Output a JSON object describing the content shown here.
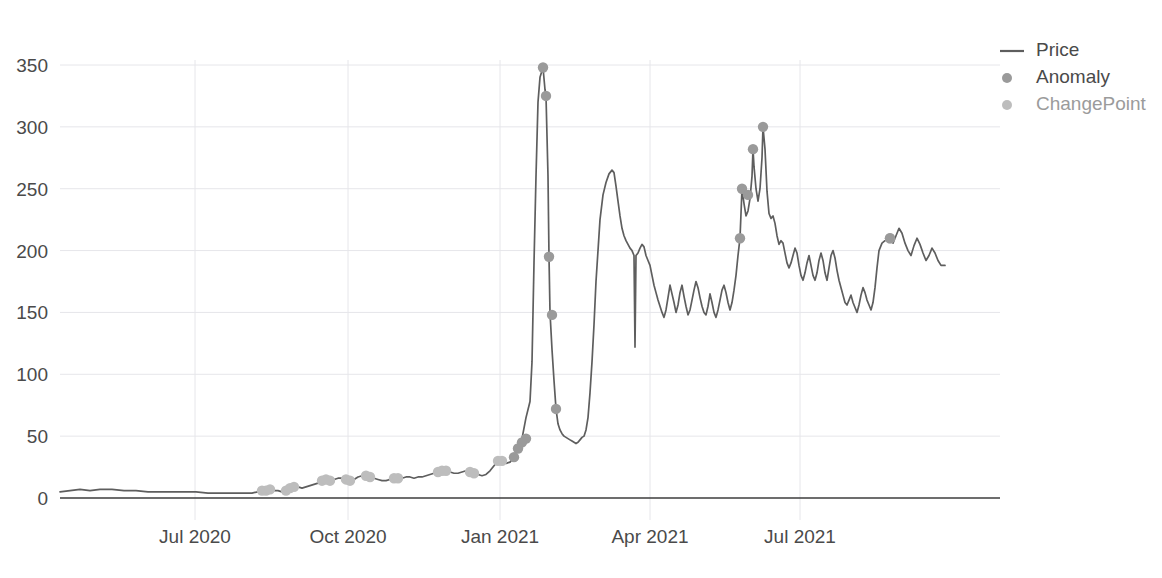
{
  "chart_data": {
    "type": "line",
    "title": "",
    "xlabel": "",
    "ylabel": "",
    "ylim": [
      0,
      365
    ],
    "yticks": [
      0,
      50,
      100,
      150,
      200,
      250,
      300,
      350
    ],
    "ytick_labels": [
      "0",
      "50",
      "100",
      "150",
      "200",
      "250",
      "300",
      "350"
    ],
    "xtick_labels": [
      "Jul 2020",
      "Oct 2020",
      "Jan 2021",
      "Apr 2021",
      "Jul 2021"
    ],
    "xtick_positions": [
      195,
      348,
      500,
      650,
      800
    ],
    "grid": true,
    "legend_position": "right",
    "legend": [
      {
        "name": "Price",
        "marker": "line",
        "color": "#5e5e5e",
        "muted": false
      },
      {
        "name": "Anomaly",
        "marker": "dot",
        "color": "#9a9a9a",
        "muted": false
      },
      {
        "name": "ChangePoint",
        "marker": "dot",
        "color": "#bdbdbd",
        "muted": true
      }
    ],
    "series": [
      {
        "name": "Price",
        "type": "line",
        "points": [
          [
            60,
            5
          ],
          [
            70,
            6
          ],
          [
            80,
            7
          ],
          [
            90,
            6
          ],
          [
            100,
            7
          ],
          [
            112,
            7
          ],
          [
            124,
            6
          ],
          [
            136,
            6
          ],
          [
            148,
            5
          ],
          [
            160,
            5
          ],
          [
            172,
            5
          ],
          [
            184,
            5
          ],
          [
            196,
            5
          ],
          [
            208,
            4
          ],
          [
            220,
            4
          ],
          [
            232,
            4
          ],
          [
            244,
            4
          ],
          [
            252,
            4
          ],
          [
            258,
            5
          ],
          [
            262,
            6
          ],
          [
            266,
            6
          ],
          [
            270,
            7
          ],
          [
            274,
            6
          ],
          [
            278,
            6
          ],
          [
            282,
            5
          ],
          [
            286,
            6
          ],
          [
            290,
            8
          ],
          [
            294,
            9
          ],
          [
            298,
            9
          ],
          [
            302,
            8
          ],
          [
            306,
            9
          ],
          [
            310,
            10
          ],
          [
            314,
            11
          ],
          [
            318,
            12
          ],
          [
            322,
            14
          ],
          [
            326,
            15
          ],
          [
            330,
            14
          ],
          [
            334,
            15
          ],
          [
            338,
            16
          ],
          [
            342,
            16
          ],
          [
            346,
            15
          ],
          [
            350,
            14
          ],
          [
            354,
            15
          ],
          [
            358,
            17
          ],
          [
            362,
            18
          ],
          [
            366,
            18
          ],
          [
            370,
            17
          ],
          [
            374,
            16
          ],
          [
            378,
            15
          ],
          [
            382,
            14
          ],
          [
            386,
            14
          ],
          [
            390,
            15
          ],
          [
            394,
            16
          ],
          [
            398,
            16
          ],
          [
            402,
            16
          ],
          [
            406,
            17
          ],
          [
            410,
            17
          ],
          [
            414,
            16
          ],
          [
            418,
            17
          ],
          [
            422,
            17
          ],
          [
            426,
            18
          ],
          [
            430,
            19
          ],
          [
            434,
            20
          ],
          [
            438,
            21
          ],
          [
            442,
            22
          ],
          [
            446,
            22
          ],
          [
            450,
            21
          ],
          [
            454,
            20
          ],
          [
            458,
            20
          ],
          [
            462,
            21
          ],
          [
            466,
            22
          ],
          [
            470,
            21
          ],
          [
            474,
            20
          ],
          [
            478,
            19
          ],
          [
            482,
            18
          ],
          [
            486,
            19
          ],
          [
            490,
            22
          ],
          [
            494,
            26
          ],
          [
            498,
            30
          ],
          [
            502,
            30
          ],
          [
            506,
            28
          ],
          [
            510,
            29
          ],
          [
            514,
            33
          ],
          [
            518,
            40
          ],
          [
            522,
            48
          ],
          [
            526,
            65
          ],
          [
            530,
            78
          ],
          [
            532,
            110
          ],
          [
            534,
            190
          ],
          [
            536,
            260
          ],
          [
            538,
            320
          ],
          [
            540,
            340
          ],
          [
            543,
            348
          ],
          [
            545,
            330
          ],
          [
            546,
            325
          ],
          [
            548,
            260
          ],
          [
            549,
            195
          ],
          [
            550,
            150
          ],
          [
            552,
            120
          ],
          [
            554,
            95
          ],
          [
            556,
            72
          ],
          [
            558,
            60
          ],
          [
            560,
            55
          ],
          [
            562,
            52
          ],
          [
            564,
            50
          ],
          [
            566,
            49
          ],
          [
            568,
            48
          ],
          [
            570,
            47
          ],
          [
            572,
            46
          ],
          [
            574,
            45
          ],
          [
            576,
            44
          ],
          [
            578,
            45
          ],
          [
            580,
            47
          ],
          [
            582,
            49
          ],
          [
            584,
            50
          ],
          [
            586,
            55
          ],
          [
            588,
            65
          ],
          [
            590,
            85
          ],
          [
            592,
            110
          ],
          [
            594,
            140
          ],
          [
            596,
            175
          ],
          [
            598,
            200
          ],
          [
            600,
            225
          ],
          [
            603,
            245
          ],
          [
            606,
            255
          ],
          [
            609,
            262
          ],
          [
            612,
            265
          ],
          [
            614,
            263
          ],
          [
            616,
            252
          ],
          [
            618,
            240
          ],
          [
            620,
            228
          ],
          [
            622,
            218
          ],
          [
            624,
            212
          ],
          [
            626,
            208
          ],
          [
            628,
            205
          ],
          [
            630,
            202
          ],
          [
            632,
            200
          ],
          [
            634,
            196
          ],
          [
            635,
            122
          ],
          [
            636,
            196
          ],
          [
            638,
            198
          ],
          [
            640,
            202
          ],
          [
            642,
            205
          ],
          [
            644,
            203
          ],
          [
            646,
            196
          ],
          [
            648,
            192
          ],
          [
            650,
            188
          ],
          [
            652,
            180
          ],
          [
            654,
            172
          ],
          [
            656,
            166
          ],
          [
            658,
            160
          ],
          [
            660,
            155
          ],
          [
            662,
            150
          ],
          [
            664,
            146
          ],
          [
            666,
            152
          ],
          [
            668,
            162
          ],
          [
            670,
            172
          ],
          [
            672,
            165
          ],
          [
            674,
            158
          ],
          [
            676,
            150
          ],
          [
            678,
            156
          ],
          [
            680,
            166
          ],
          [
            682,
            172
          ],
          [
            684,
            163
          ],
          [
            686,
            155
          ],
          [
            688,
            148
          ],
          [
            690,
            152
          ],
          [
            692,
            160
          ],
          [
            694,
            168
          ],
          [
            696,
            175
          ],
          [
            698,
            170
          ],
          [
            700,
            162
          ],
          [
            702,
            155
          ],
          [
            704,
            150
          ],
          [
            706,
            148
          ],
          [
            708,
            155
          ],
          [
            710,
            165
          ],
          [
            712,
            158
          ],
          [
            714,
            150
          ],
          [
            716,
            146
          ],
          [
            718,
            152
          ],
          [
            720,
            160
          ],
          [
            722,
            168
          ],
          [
            724,
            172
          ],
          [
            726,
            166
          ],
          [
            728,
            158
          ],
          [
            730,
            152
          ],
          [
            732,
            158
          ],
          [
            734,
            168
          ],
          [
            736,
            180
          ],
          [
            738,
            196
          ],
          [
            740,
            210
          ],
          [
            742,
            250
          ],
          [
            744,
            238
          ],
          [
            746,
            228
          ],
          [
            748,
            232
          ],
          [
            750,
            242
          ],
          [
            752,
            260
          ],
          [
            753,
            282
          ],
          [
            754,
            268
          ],
          [
            756,
            250
          ],
          [
            758,
            240
          ],
          [
            760,
            250
          ],
          [
            762,
            275
          ],
          [
            763,
            300
          ],
          [
            765,
            282
          ],
          [
            767,
            248
          ],
          [
            769,
            230
          ],
          [
            771,
            226
          ],
          [
            773,
            228
          ],
          [
            775,
            222
          ],
          [
            777,
            212
          ],
          [
            779,
            205
          ],
          [
            781,
            208
          ],
          [
            783,
            206
          ],
          [
            785,
            198
          ],
          [
            787,
            190
          ],
          [
            789,
            186
          ],
          [
            791,
            190
          ],
          [
            793,
            196
          ],
          [
            795,
            202
          ],
          [
            797,
            198
          ],
          [
            799,
            188
          ],
          [
            801,
            180
          ],
          [
            803,
            176
          ],
          [
            805,
            182
          ],
          [
            807,
            190
          ],
          [
            809,
            196
          ],
          [
            811,
            188
          ],
          [
            813,
            180
          ],
          [
            815,
            176
          ],
          [
            817,
            182
          ],
          [
            819,
            192
          ],
          [
            821,
            198
          ],
          [
            823,
            192
          ],
          [
            825,
            182
          ],
          [
            827,
            176
          ],
          [
            829,
            186
          ],
          [
            831,
            196
          ],
          [
            833,
            200
          ],
          [
            835,
            194
          ],
          [
            837,
            184
          ],
          [
            839,
            176
          ],
          [
            841,
            170
          ],
          [
            843,
            164
          ],
          [
            845,
            158
          ],
          [
            847,
            156
          ],
          [
            849,
            160
          ],
          [
            851,
            164
          ],
          [
            853,
            158
          ],
          [
            855,
            154
          ],
          [
            857,
            150
          ],
          [
            859,
            156
          ],
          [
            861,
            164
          ],
          [
            863,
            170
          ],
          [
            865,
            166
          ],
          [
            867,
            160
          ],
          [
            869,
            156
          ],
          [
            871,
            152
          ],
          [
            873,
            158
          ],
          [
            875,
            170
          ],
          [
            877,
            186
          ],
          [
            879,
            200
          ],
          [
            882,
            206
          ],
          [
            885,
            208
          ],
          [
            888,
            209
          ],
          [
            890,
            210
          ],
          [
            893,
            206
          ],
          [
            896,
            212
          ],
          [
            899,
            218
          ],
          [
            902,
            214
          ],
          [
            905,
            206
          ],
          [
            908,
            200
          ],
          [
            911,
            196
          ],
          [
            914,
            204
          ],
          [
            917,
            210
          ],
          [
            920,
            205
          ],
          [
            923,
            198
          ],
          [
            926,
            192
          ],
          [
            929,
            196
          ],
          [
            932,
            202
          ],
          [
            935,
            198
          ],
          [
            938,
            192
          ],
          [
            941,
            188
          ],
          [
            945,
            188
          ]
        ]
      },
      {
        "name": "Anomaly",
        "type": "scatter",
        "points": [
          [
            543,
            348
          ],
          [
            546,
            325
          ],
          [
            549,
            195
          ],
          [
            552,
            148
          ],
          [
            556,
            72
          ],
          [
            526,
            48
          ],
          [
            522,
            45
          ],
          [
            518,
            40
          ],
          [
            514,
            33
          ],
          [
            763,
            300
          ],
          [
            753,
            282
          ],
          [
            742,
            250
          ],
          [
            748,
            245
          ],
          [
            740,
            210
          ],
          [
            890,
            210
          ]
        ]
      },
      {
        "name": "ChangePoint",
        "type": "scatter",
        "points": [
          [
            262,
            6
          ],
          [
            266,
            6
          ],
          [
            270,
            7
          ],
          [
            286,
            6
          ],
          [
            290,
            8
          ],
          [
            294,
            9
          ],
          [
            322,
            14
          ],
          [
            326,
            15
          ],
          [
            330,
            14
          ],
          [
            346,
            15
          ],
          [
            350,
            14
          ],
          [
            366,
            18
          ],
          [
            370,
            17
          ],
          [
            394,
            16
          ],
          [
            398,
            16
          ],
          [
            438,
            21
          ],
          [
            442,
            22
          ],
          [
            446,
            22
          ],
          [
            470,
            21
          ],
          [
            474,
            20
          ],
          [
            498,
            30
          ],
          [
            502,
            30
          ],
          [
            890,
            210
          ]
        ]
      }
    ]
  },
  "axes": {
    "plot_left": 60,
    "plot_right": 960,
    "plot_top": 60,
    "plot_bottom": 498
  }
}
